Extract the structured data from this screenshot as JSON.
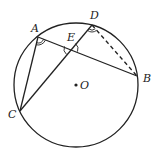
{
  "diagram": {
    "type": "circle-geometry",
    "circle": {
      "center_label": "O",
      "cx": 76,
      "cy": 85,
      "r": 62
    },
    "points": {
      "A": {
        "label": "A",
        "x": 38,
        "y": 37
      },
      "B": {
        "label": "B",
        "x": 137,
        "y": 76
      },
      "C": {
        "label": "C",
        "x": 20,
        "y": 111
      },
      "D": {
        "label": "D",
        "x": 92,
        "y": 25
      },
      "E": {
        "label": "E",
        "x": 71,
        "y": 49
      },
      "O": {
        "label": "O",
        "x": 76,
        "y": 85
      }
    },
    "segments": [
      {
        "from": "A",
        "to": "B",
        "style": "solid"
      },
      {
        "from": "A",
        "to": "C",
        "style": "solid"
      },
      {
        "from": "C",
        "to": "D",
        "style": "solid"
      },
      {
        "from": "D",
        "to": "B",
        "style": "dashed"
      }
    ],
    "angle_marks": [
      {
        "at": "A",
        "between": [
          "C",
          "B"
        ],
        "style": "double-arc"
      },
      {
        "at": "E",
        "between": [
          "C",
          "A"
        ],
        "style": "single-arc"
      },
      {
        "at": "E",
        "between": [
          "A",
          "D"
        ],
        "style": "single-arc"
      },
      {
        "at": "D",
        "between": [
          "C",
          "B"
        ],
        "style": "double-arc"
      }
    ],
    "stroke_color": "#222222",
    "background_color": "#ffffff"
  }
}
